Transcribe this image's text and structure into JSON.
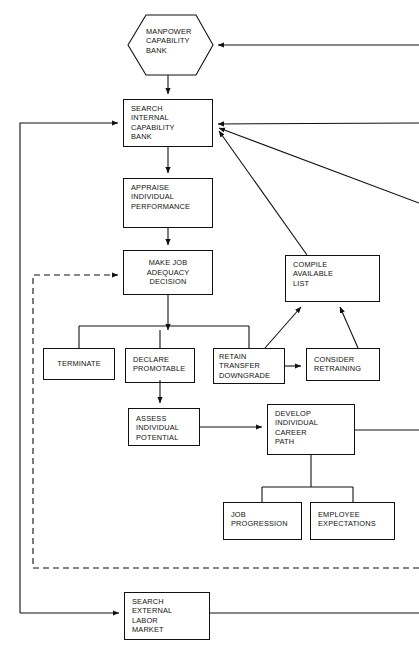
{
  "diagram": {
    "stroke_color": "#111111",
    "background_color": "#ffffff",
    "nodes": [
      {
        "id": "manpower_capability_bank",
        "label": "MANPOWER\nCAPABILITY\nBANK",
        "shape": "hexagon"
      },
      {
        "id": "search_internal_capability_bank",
        "label": "SEARCH\nINTERNAL\nCAPABILITY\nBANK",
        "shape": "rect"
      },
      {
        "id": "appraise_individual_performance",
        "label": "APPRAISE\nINDIVIDUAL\nPERFORMANCE",
        "shape": "rect"
      },
      {
        "id": "make_job_adequacy_decision",
        "label": "MAKE JOB\nADEQUACY\nDECISION",
        "shape": "rect"
      },
      {
        "id": "compile_available_list",
        "label": "COMPILE\nAVAILABLE\nLIST",
        "shape": "rect"
      },
      {
        "id": "terminate",
        "label": "TERMINATE",
        "shape": "rect"
      },
      {
        "id": "declare_promotable",
        "label": "DECLARE\nPROMOTABLE",
        "shape": "rect"
      },
      {
        "id": "retain_transfer_downgrade",
        "label": "RETAIN\nTRANSFER\nDOWNGRADE",
        "shape": "rect"
      },
      {
        "id": "consider_retraining",
        "label": "CONSIDER\nRETRAINING",
        "shape": "rect"
      },
      {
        "id": "assess_individual_potential",
        "label": "ASSESS\nINDIVIDUAL\nPOTENTIAL",
        "shape": "rect"
      },
      {
        "id": "develop_individual_career_path",
        "label": "DEVELOP\nINDIVIDUAL\nCAREER\nPATH",
        "shape": "rect"
      },
      {
        "id": "job_progression",
        "label": "JOB\nPROGRESSION",
        "shape": "rect"
      },
      {
        "id": "employee_expectations",
        "label": "EMPLOYEE\nEXPECTATIONS",
        "shape": "rect"
      },
      {
        "id": "search_external_labor_market",
        "label": "SEARCH\nEXTERNAL\nLABOR\nMARKET",
        "shape": "rect"
      }
    ]
  }
}
